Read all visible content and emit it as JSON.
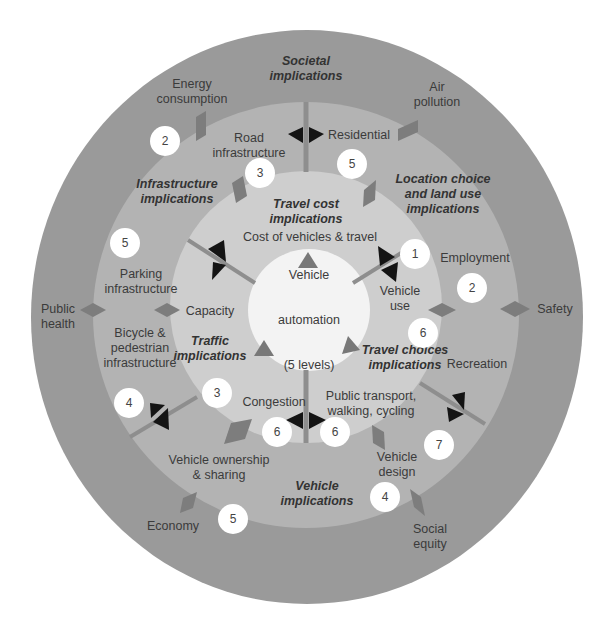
{
  "colors": {
    "outer_ring": "#9a9a9a",
    "middle_ring": "#b4b4b4",
    "inner_ring": "#cfcfcf",
    "core": "#f4f4f4",
    "diamond": "#7e7e7e",
    "divider": "#8c8c8c",
    "arrow": "#141414",
    "triangle": "#7a7a7a",
    "badge": "#ffffff"
  },
  "center": {
    "line1": "Vehicle",
    "line2": "automation",
    "line3": "(5 levels)"
  },
  "categories": {
    "societal": "Societal\nimplications",
    "infrastructure": "Infrastructure\nimplications",
    "travel_cost": "Travel cost\nimplications",
    "location": "Location choice\nand land use\nimplications",
    "traffic": "Traffic\nimplications",
    "travel_choices": "Travel choices\nimplications",
    "vehicle": "Vehicle\nimplications"
  },
  "inner_items": {
    "cost": "Cost of vehicles & travel",
    "capacity": "Capacity",
    "congestion": "Congestion",
    "vehicle_use": "Vehicle\nuse",
    "public_transport": "Public transport,\nwalking, cycling"
  },
  "middle_items": {
    "road_infrastructure": "Road\ninfrastructure",
    "residential": "Residential",
    "parking": "Parking\ninfrastructure",
    "bicycle": "Bicycle &\npedestrian\ninfrastructure",
    "employment": "Employment",
    "recreation": "Recreation",
    "ownership": "Vehicle ownership\n& sharing",
    "design": "Vehicle\ndesign"
  },
  "outer_items": {
    "energy": "Energy\nconsumption",
    "air": "Air\npollution",
    "public_health": "Public\nhealth",
    "safety": "Safety",
    "economy": "Economy",
    "social_equity": "Social\nequity"
  },
  "badges": [
    {
      "id": "energy",
      "value": "2"
    },
    {
      "id": "road",
      "value": "3"
    },
    {
      "id": "residential",
      "value": "5"
    },
    {
      "id": "parking",
      "value": "5"
    },
    {
      "id": "employment-inner",
      "value": "1"
    },
    {
      "id": "employment",
      "value": "2"
    },
    {
      "id": "vehicle-use",
      "value": "6"
    },
    {
      "id": "bicycle",
      "value": "4"
    },
    {
      "id": "traffic",
      "value": "3"
    },
    {
      "id": "congestion",
      "value": "6"
    },
    {
      "id": "public-transport",
      "value": "6"
    },
    {
      "id": "recreation",
      "value": "7"
    },
    {
      "id": "design",
      "value": "4"
    },
    {
      "id": "economy",
      "value": "5"
    }
  ]
}
